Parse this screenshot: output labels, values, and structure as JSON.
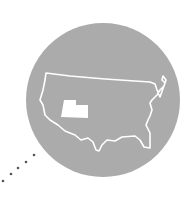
{
  "illustration": {
    "subject": "US map with highlighted state",
    "highlighted_state": "Colorado",
    "colors": {
      "background": "#ffffff",
      "circle": "#ababab",
      "outline": "#ffffff",
      "highlight": "#ffffff",
      "dots": "#555555"
    },
    "dots_count": 5
  }
}
